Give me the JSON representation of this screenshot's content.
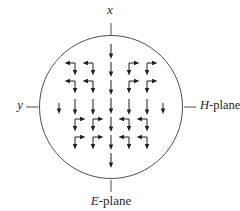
{
  "labels": {
    "x_axis": "x",
    "y_axis": "y",
    "h_plane_prefix": "H",
    "h_plane_suffix": "-plane",
    "e_plane_prefix": "E",
    "e_plane_suffix": "-plane"
  },
  "diagram": {
    "type": "aperture-vector-field",
    "ink_color": "#1f1f1f",
    "outline_color": "#4f4f4f",
    "canvas": {
      "width": 240,
      "height": 211
    },
    "circle": {
      "cx": 111,
      "cy": 107,
      "r": 71.5
    },
    "ticks": [
      [
        111,
        23,
        111,
        35
      ],
      [
        26,
        107,
        38,
        107
      ],
      [
        184,
        107,
        196,
        107
      ],
      [
        111,
        180,
        111,
        192
      ]
    ],
    "arrows": {
      "down": [
        [
          111,
          44,
          15
        ],
        [
          111,
          62,
          15
        ],
        [
          111,
          80,
          15
        ],
        [
          59,
          103,
          11
        ],
        [
          75,
          99,
          16
        ],
        [
          93,
          99,
          16
        ],
        [
          111,
          98,
          16
        ],
        [
          129,
          99,
          16
        ],
        [
          147,
          99,
          16
        ],
        [
          163,
          103,
          11
        ],
        [
          111,
          117,
          15
        ],
        [
          111,
          135,
          15
        ],
        [
          111,
          153,
          15
        ]
      ],
      "elbow": [
        [
          75,
          63,
          -1
        ],
        [
          93,
          63,
          -1
        ],
        [
          129,
          63,
          1
        ],
        [
          147,
          63,
          1
        ],
        [
          75,
          81,
          -1
        ],
        [
          93,
          81,
          -1
        ],
        [
          129,
          81,
          1
        ],
        [
          147,
          81,
          1
        ],
        [
          75,
          119,
          1
        ],
        [
          93,
          119,
          1
        ],
        [
          129,
          119,
          -1
        ],
        [
          147,
          119,
          -1
        ],
        [
          75,
          137,
          1
        ],
        [
          93,
          137,
          1
        ],
        [
          129,
          137,
          -1
        ],
        [
          147,
          137,
          -1
        ]
      ],
      "elbow_h_len": 10.5,
      "elbow_v_len": 12.5,
      "head_len": 5.5,
      "head_half_width": 2.2
    }
  }
}
